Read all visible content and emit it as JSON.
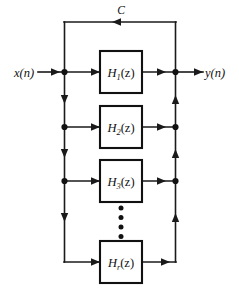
{
  "figure": {
    "type": "block-diagram",
    "background_color": "#ffffff",
    "line_color": "#1a1a1a"
  },
  "signals": {
    "input_label": "x(n)",
    "output_label": "y(n)",
    "feedback_label": "C"
  },
  "blocks": [
    {
      "id": "h1",
      "base": "H",
      "subscript": "1",
      "argument": "(z)",
      "label": "H1(z)"
    },
    {
      "id": "h2",
      "base": "H",
      "subscript": "2",
      "argument": "(z)",
      "label": "H2(z)"
    },
    {
      "id": "h3",
      "base": "H",
      "subscript": "3",
      "argument": "(z)",
      "label": "H3(z)"
    },
    {
      "id": "hr",
      "base": "H",
      "subscript": "r",
      "argument": "(z)",
      "label": "Hr(z)"
    }
  ],
  "ellipsis": {
    "name": "vertical-ellipsis",
    "dot_count": 4
  }
}
